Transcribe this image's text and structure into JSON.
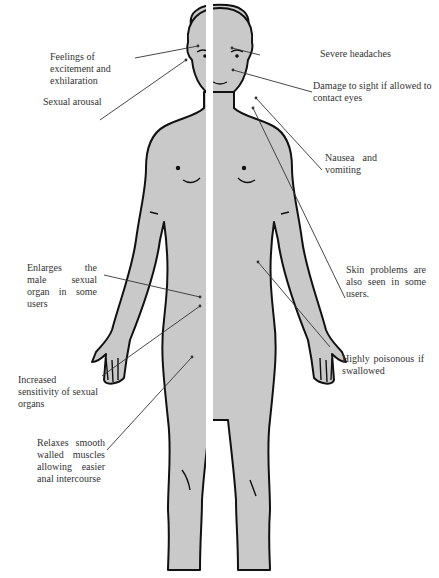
{
  "diagram": {
    "colors": {
      "body_fill": "#c9c9c9",
      "outline": "#111111",
      "divider": "#ffffff",
      "leader_line": "#333333",
      "text": "#333333",
      "background": "#ffffff"
    }
  },
  "labels": {
    "excitement": "Feelings of excitement and exhilaration",
    "arousal": "Sexual arousal",
    "headaches": "Severe headaches",
    "sight": "Damage to sight if allowed to contact eyes",
    "nausea": "Nausea and vomiting",
    "skin": "Skin problems are also seen in some users.",
    "poisonous": "Highly poisonous if swallowed",
    "enlarges": "Enlarges the male sexual organ in some users",
    "sensitivity": "Increased sensitivity of sexual organs",
    "relaxes": "Relaxes smooth walled muscles allowing easier anal intercourse"
  }
}
